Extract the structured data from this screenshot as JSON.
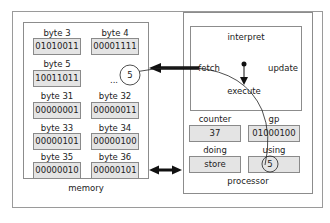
{
  "memory": {
    "title": "memory",
    "ellipsis": "...",
    "bytes": [
      {
        "label": "byte 3",
        "value": "01010011"
      },
      {
        "label": "byte 4",
        "value": "00001111"
      },
      {
        "label": "byte 5",
        "value": "10011011"
      },
      {
        "label": "byte 31",
        "value": "00000001"
      },
      {
        "label": "byte 32",
        "value": "00000011"
      },
      {
        "label": "byte 33",
        "value": "00000101"
      },
      {
        "label": "byte 34",
        "value": "00000100"
      },
      {
        "label": "byte 35",
        "value": "00000010"
      },
      {
        "label": "byte 36",
        "value": "00000101"
      }
    ],
    "fetched_marker": "5"
  },
  "processor": {
    "title": "processor",
    "cycle": {
      "interpret": "interpret",
      "fetch": "fetch",
      "update": "update",
      "execute": "execute"
    },
    "registers": {
      "counter": {
        "label": "counter",
        "value": "37"
      },
      "gp": {
        "label": "gp",
        "value": "01000100"
      },
      "doing": {
        "label": "doing",
        "value": "store"
      },
      "using": {
        "label": "using",
        "value": "5"
      }
    }
  },
  "colors": {
    "cell_fill": "#e4e4e4",
    "border": "#8a8a8a",
    "arrow": "#111111"
  }
}
